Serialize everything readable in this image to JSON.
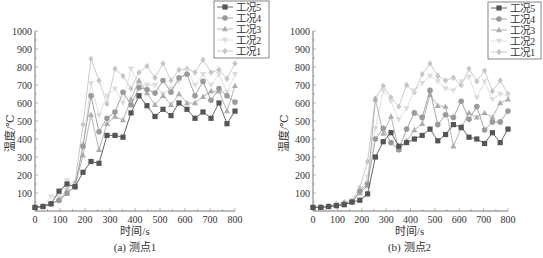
{
  "chart_data": [
    {
      "type": "line",
      "title": "(a) 测点1",
      "xlabel": "时间/s",
      "ylabel": "温度/℃",
      "xlim": [
        0,
        800
      ],
      "ylim": [
        0,
        1000
      ],
      "xticks": [
        0,
        100,
        200,
        300,
        400,
        500,
        600,
        700,
        800
      ],
      "yticks": [
        100,
        200,
        300,
        400,
        500,
        600,
        700,
        800,
        900,
        1000
      ],
      "grid": false,
      "legend_position": "top-right",
      "x": [
        0,
        32,
        64,
        96,
        128,
        160,
        192,
        224,
        256,
        288,
        320,
        352,
        384,
        416,
        448,
        480,
        512,
        544,
        576,
        608,
        640,
        672,
        704,
        736,
        768,
        800
      ],
      "series": [
        {
          "name": "工况5",
          "marker": "square",
          "color": "#555555",
          "values": [
            20,
            25,
            40,
            110,
            150,
            135,
            215,
            275,
            265,
            420,
            420,
            410,
            545,
            640,
            585,
            525,
            565,
            530,
            600,
            565,
            515,
            550,
            515,
            600,
            485,
            555
          ]
        },
        {
          "name": "工况4",
          "marker": "circle",
          "color": "#9a9a9a",
          "values": [
            20,
            25,
            40,
            60,
            100,
            135,
            360,
            640,
            440,
            515,
            550,
            660,
            590,
            685,
            675,
            655,
            725,
            660,
            740,
            760,
            640,
            720,
            615,
            680,
            640,
            605
          ]
        },
        {
          "name": "工况3",
          "marker": "triangle-up",
          "color": "#adadad",
          "values": [
            20,
            25,
            40,
            60,
            95,
            140,
            310,
            535,
            340,
            485,
            525,
            505,
            620,
            725,
            655,
            590,
            640,
            590,
            650,
            600,
            600,
            635,
            665,
            665,
            555,
            695
          ]
        },
        {
          "name": "工况2",
          "marker": "triangle-down",
          "color": "#dcdcdc",
          "values": [
            20,
            25,
            80,
            80,
            170,
            140,
            370,
            710,
            530,
            640,
            680,
            600,
            790,
            700,
            700,
            700,
            650,
            680,
            720,
            780,
            700,
            760,
            700,
            760,
            660,
            760
          ]
        },
        {
          "name": "工况1",
          "marker": "diamond",
          "color": "#c6c6c6",
          "values": [
            20,
            25,
            40,
            60,
            120,
            160,
            480,
            845,
            725,
            595,
            790,
            750,
            680,
            770,
            805,
            740,
            820,
            725,
            785,
            790,
            770,
            840,
            770,
            785,
            735,
            820
          ]
        }
      ]
    },
    {
      "type": "line",
      "title": "(b) 测点2",
      "xlabel": "时间/s",
      "ylabel": "温度/℃",
      "xlim": [
        0,
        800
      ],
      "ylim": [
        0,
        1000
      ],
      "xticks": [
        0,
        100,
        200,
        300,
        400,
        500,
        600,
        700,
        800
      ],
      "yticks": [
        100,
        200,
        300,
        400,
        500,
        600,
        700,
        800,
        900,
        1000
      ],
      "grid": false,
      "legend_position": "top-right",
      "x": [
        0,
        32,
        64,
        96,
        128,
        160,
        192,
        224,
        256,
        288,
        320,
        352,
        384,
        416,
        448,
        480,
        512,
        544,
        576,
        608,
        640,
        672,
        704,
        736,
        768,
        800
      ],
      "series": [
        {
          "name": "工况5",
          "marker": "square",
          "color": "#555555",
          "values": [
            20,
            20,
            25,
            30,
            35,
            50,
            60,
            95,
            300,
            385,
            435,
            360,
            380,
            400,
            420,
            455,
            390,
            425,
            480,
            465,
            410,
            400,
            375,
            435,
            380,
            455
          ]
        },
        {
          "name": "工况4",
          "marker": "circle",
          "color": "#9a9a9a",
          "values": [
            20,
            20,
            25,
            30,
            40,
            50,
            110,
            150,
            400,
            460,
            380,
            340,
            455,
            545,
            520,
            670,
            480,
            535,
            520,
            610,
            510,
            580,
            450,
            495,
            495,
            555
          ]
        },
        {
          "name": "工况3",
          "marker": "triangle-up",
          "color": "#adadad",
          "values": [
            20,
            20,
            25,
            30,
            35,
            50,
            100,
            140,
            620,
            430,
            525,
            340,
            390,
            450,
            485,
            645,
            585,
            580,
            360,
            460,
            545,
            520,
            545,
            520,
            600,
            620
          ]
        },
        {
          "name": "工况2",
          "marker": "triangle-down",
          "color": "#dcdcdc",
          "values": [
            20,
            20,
            25,
            35,
            40,
            60,
            100,
            190,
            460,
            670,
            610,
            510,
            570,
            670,
            710,
            750,
            720,
            680,
            670,
            720,
            745,
            630,
            720,
            620,
            650,
            640
          ]
        },
        {
          "name": "工况1",
          "marker": "diamond",
          "color": "#c6c6c6",
          "values": [
            20,
            20,
            25,
            40,
            50,
            60,
            130,
            275,
            625,
            695,
            630,
            580,
            700,
            660,
            760,
            820,
            750,
            725,
            740,
            700,
            790,
            720,
            780,
            665,
            725,
            650
          ]
        }
      ]
    }
  ],
  "panels": [
    {
      "caption": "(a) 测点1",
      "xlabel": "时间/s",
      "ylabel": "温度/℃"
    },
    {
      "caption": "(b) 测点2",
      "xlabel": "时间/s",
      "ylabel": "温度/℃"
    }
  ]
}
